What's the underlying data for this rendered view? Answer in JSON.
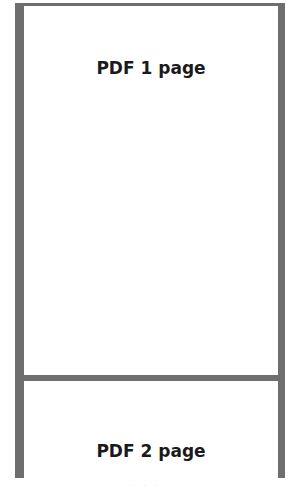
{
  "viewer": {
    "pages": [
      {
        "label": "PDF 1 page"
      },
      {
        "label": "PDF 2 page"
      }
    ],
    "footer_text": "· · ·"
  },
  "colors": {
    "frame": "#6e6e6e",
    "page": "#ffffff",
    "text": "#1a1a1a"
  }
}
